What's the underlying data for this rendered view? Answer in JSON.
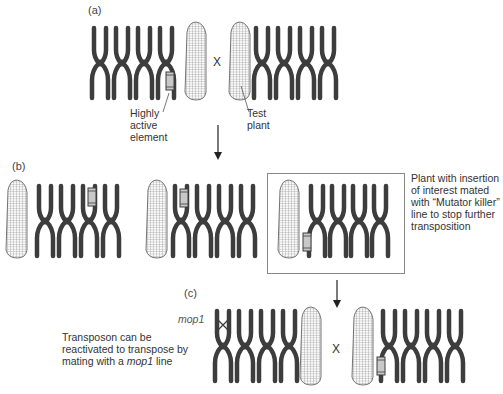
{
  "panels": {
    "a": {
      "label": "(a)",
      "cross_symbol": "X",
      "labels": {
        "element": [
          "Highly",
          "active",
          "element"
        ],
        "test_plant": [
          "Test",
          "plant"
        ]
      }
    },
    "b": {
      "label": "(b)",
      "description": [
        "Plant with insertion",
        "of interest mated",
        "with “Mutator killer”",
        "line to stop further",
        "transposition"
      ]
    },
    "c": {
      "label": "(c)",
      "cross_symbol": "X",
      "mop1_label": "mop1",
      "description_line1": "Transposon can be",
      "description_line2": "reactivated to transpose by",
      "description_line3_prefix": "mating with a ",
      "description_line3_italic": "mop1",
      "description_line3_suffix": " line"
    }
  },
  "colors": {
    "chromosome": "#3d3d3d",
    "transposon_fill": "#c8c8c8",
    "corn_outline": "#666666",
    "box_border": "#888888"
  }
}
